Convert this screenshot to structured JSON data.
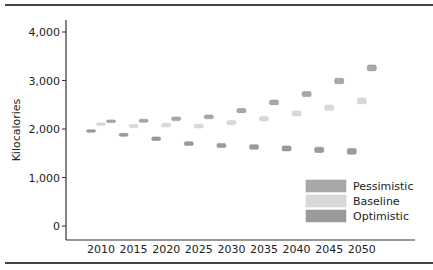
{
  "chart_data": {
    "type": "scatter",
    "title": "",
    "xlabel": "",
    "ylabel": "Kilocalories",
    "ylim": [
      0,
      4000
    ],
    "yticks": [
      0,
      1000,
      2000,
      3000,
      4000
    ],
    "ytick_labels": [
      "0",
      "1,000",
      "2,000",
      "3,000",
      "4,000"
    ],
    "categories": [
      "2010",
      "2015",
      "2020",
      "2025",
      "2030",
      "2035",
      "2040",
      "2045",
      "2050"
    ],
    "grid": false,
    "legend_position": "lower right",
    "series": [
      {
        "name": "Optimistic",
        "color": "#9a9a9a",
        "values": [
          1960,
          1880,
          1800,
          1700,
          1660,
          1630,
          1600,
          1570,
          1540
        ]
      },
      {
        "name": "Baseline",
        "color": "#d9d9d9",
        "values": [
          2100,
          2060,
          2080,
          2060,
          2130,
          2210,
          2320,
          2440,
          2580
        ]
      },
      {
        "name": "Pessimistic",
        "color": "#a8a8a8",
        "values": [
          2160,
          2170,
          2210,
          2250,
          2380,
          2550,
          2720,
          2990,
          3260
        ]
      }
    ],
    "legend": [
      "Pessimistic",
      "Baseline",
      "Optimistic"
    ]
  }
}
